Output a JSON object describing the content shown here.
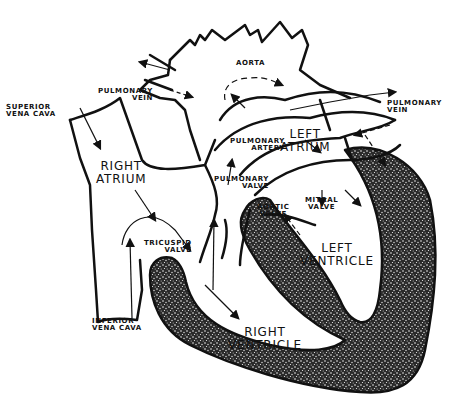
{
  "diagram": {
    "colors": {
      "line": "#111111",
      "background": "#ffffff",
      "muscle_fill": "#2a2a2a",
      "muscle_speckle": "#f2f2f2"
    },
    "labels": {
      "superior_vena_cava": "SUPERIOR\nVENA CAVA",
      "pulmonary_vein_left": "PULMONARY\nVEIN",
      "aorta": "AORTA",
      "pulmonary_vein_right": "PULMONARY\nVEIN",
      "right_atrium": "RIGHT\nATRIUM",
      "left_atrium": "LEFT\nATRIUM",
      "pulmonary_artery": "PULMONARY\nARTERY",
      "pulmonary_valve": "PULMONARY\nVALVE",
      "aortic_valve": "AORTIC\nVALVE",
      "mitral_valve": "MITRAL\nVALVE",
      "tricuspid_valve": "TRICUSPID\nVALVE",
      "left_ventricle": "LEFT\nVENTRICLE",
      "inferior_vena_cava": "INFERIOR\nVENA CAVA",
      "right_ventricle": "RIGHT\nVENTRICLE"
    }
  }
}
